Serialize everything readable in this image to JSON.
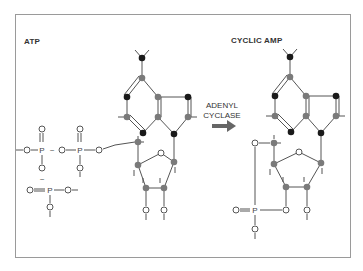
{
  "figure": {
    "left_label": "ATP",
    "right_label": "CYCLIC AMP",
    "enzyme_label_line1": "ADENYL",
    "enzyme_label_line2": "CYCLASE",
    "arrow": "right-arrow"
  },
  "atom_legend": {
    "carbon_color": "#7a7a7a",
    "nitrogen_color": "#1a1a1a",
    "oxygen_style": "open-circle",
    "phosphorus_symbol": "P",
    "oxygen_symbol": "O",
    "high_energy_bond_symbol": "~"
  },
  "colors": {
    "frame": "#9a9a9a",
    "bond": "#555555",
    "arrow": "#666666",
    "text": "#333333"
  }
}
